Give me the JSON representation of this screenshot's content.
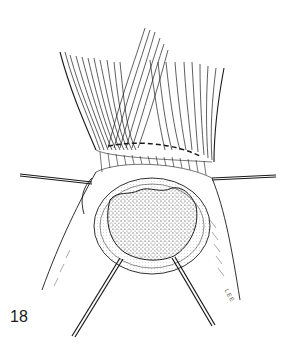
{
  "figure": {
    "number": "18",
    "signature": "LEE",
    "colors": {
      "ink": "#1a1a1a",
      "background": "#ffffff",
      "stipple": "#333333"
    }
  }
}
